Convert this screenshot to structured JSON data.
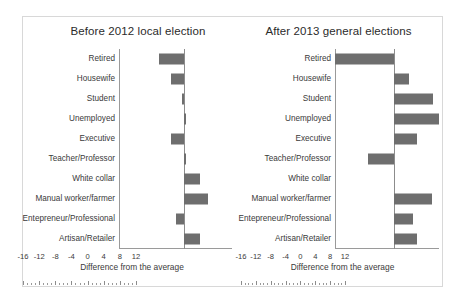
{
  "figure": {
    "panels": [
      {
        "id": "before",
        "title": "Before 2012 local election",
        "axis_title": "Difference from the average"
      },
      {
        "id": "after",
        "title": "After 2013 general elections",
        "axis_title": "Difference from the average"
      }
    ],
    "tick_labels": [
      "-16",
      "-12",
      "-8",
      "-4",
      "0",
      "4",
      "8",
      "12"
    ],
    "bar_color": "#6e6e6e",
    "axis_color": "#8c8c8c",
    "frame_color": "#d8d8d8"
  },
  "chart_data": [
    {
      "type": "bar",
      "orientation": "horizontal",
      "title": "Before 2012 local election",
      "xlabel": "Difference from the average",
      "ylabel": "",
      "xlim": [
        -16,
        12
      ],
      "xticks": [
        -16,
        -12,
        -8,
        -4,
        0,
        4,
        8,
        12
      ],
      "grid": false,
      "legend": "none",
      "categories": [
        "Retired",
        "Housewife",
        "Student",
        "Unemployed",
        "Executive",
        "Teacher/Professor",
        "White collar",
        "Manual worker/farmer",
        "Entepreneur/Professional",
        "Artisan/Retailer"
      ],
      "values": [
        -6,
        -3,
        -0.5,
        0.5,
        -3,
        0.5,
        4,
        6,
        -2,
        4
      ]
    },
    {
      "type": "bar",
      "orientation": "horizontal",
      "title": "After 2013 general elections",
      "xlabel": "Difference from the average",
      "ylabel": "",
      "xlim": [
        -16,
        12
      ],
      "xticks": [
        -16,
        -12,
        -8,
        -4,
        0,
        4,
        8,
        12
      ],
      "grid": false,
      "legend": "none",
      "categories": [
        "Retired",
        "Housewife",
        "Student",
        "Unemployed",
        "Executive",
        "Teacher/Professor",
        "White collar",
        "Manual worker/farmer",
        "Entepreneur/Professional",
        "Artisan/Retailer"
      ],
      "values": [
        -16,
        4,
        10.5,
        12,
        6,
        -7,
        0,
        10,
        5,
        6
      ]
    }
  ]
}
